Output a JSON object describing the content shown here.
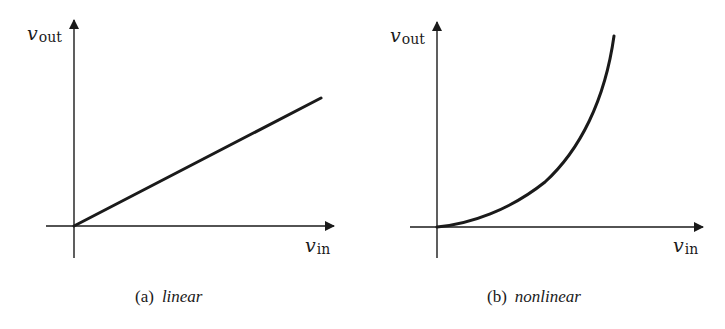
{
  "figure": {
    "panels": [
      {
        "id": "a",
        "y_axis_label": {
          "symbol": "v",
          "subscript": "out"
        },
        "x_axis_label": {
          "symbol": "v",
          "subscript": "in"
        },
        "caption_tag": "(a)",
        "caption_text": "linear"
      },
      {
        "id": "b",
        "y_axis_label": {
          "symbol": "v",
          "subscript": "out"
        },
        "x_axis_label": {
          "symbol": "v",
          "subscript": "in"
        },
        "caption_tag": "(b)",
        "caption_text": "nonlinear"
      }
    ],
    "stroke_color": "#1a1a1a",
    "background_color": "#ffffff"
  }
}
